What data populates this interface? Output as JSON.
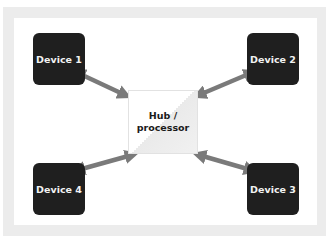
{
  "diagram": {
    "type": "hub-and-spoke",
    "hub": {
      "label_line1": "Hub /",
      "label_line2": "processor"
    },
    "devices": [
      {
        "id": 1,
        "label": "Device 1",
        "position": "top-left"
      },
      {
        "id": 2,
        "label": "Device 2",
        "position": "top-right"
      },
      {
        "id": 3,
        "label": "Device 3",
        "position": "bottom-right"
      },
      {
        "id": 4,
        "label": "Device 4",
        "position": "bottom-left"
      }
    ],
    "connections": [
      {
        "from": "Device 1",
        "to": "Hub / processor",
        "direction": "bidirectional"
      },
      {
        "from": "Device 2",
        "to": "Hub / processor",
        "direction": "bidirectional"
      },
      {
        "from": "Device 3",
        "to": "Hub / processor",
        "direction": "bidirectional"
      },
      {
        "from": "Device 4",
        "to": "Hub / processor",
        "direction": "bidirectional"
      }
    ],
    "colors": {
      "device_fill": "#1f1f1f",
      "device_text": "#f2f2f2",
      "arrow": "#7a7a7a",
      "frame": "#ececec",
      "hub_fill": "#ffffff"
    }
  }
}
